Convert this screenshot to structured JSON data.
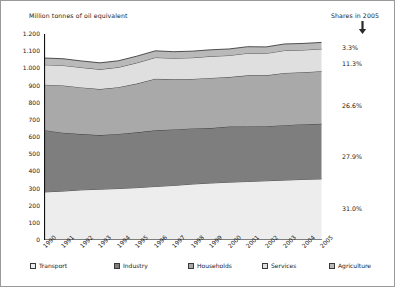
{
  "chart_data": {
    "type": "area",
    "title": "Million tonnes of oil equivalent",
    "subtitle": "Shares in 2005",
    "xlabel": "",
    "ylabel": "Million tonnes of oil equivalent",
    "ylim": [
      0,
      1200
    ],
    "ytick_step": 100,
    "grid": false,
    "legend_position": "bottom",
    "stacked": true,
    "categories": [
      "1990",
      "1991",
      "1992",
      "1993",
      "1994",
      "1995",
      "1996",
      "1997",
      "1998",
      "1999",
      "2000",
      "2001",
      "2002",
      "2003",
      "2004",
      "2005"
    ],
    "yticks": [
      "0",
      "100",
      "200",
      "300",
      "400",
      "500",
      "600",
      "700",
      "800",
      "900",
      "1.000",
      "1.100",
      "1.200"
    ],
    "series": [
      {
        "name": "Transport",
        "color": "#ededed",
        "share_2005": "31.0%",
        "values": [
          280,
          285,
          292,
          296,
          300,
          305,
          312,
          318,
          326,
          332,
          337,
          341,
          345,
          349,
          353,
          356
        ]
      },
      {
        "name": "Industry",
        "color": "#7e7e7e",
        "share_2005": "27.9%",
        "values": [
          360,
          340,
          325,
          315,
          318,
          322,
          327,
          326,
          324,
          320,
          324,
          320,
          318,
          320,
          322,
          321
        ]
      },
      {
        "name": "Households",
        "color": "#a9a9a9",
        "share_2005": "26.6%",
        "values": [
          265,
          275,
          272,
          268,
          272,
          284,
          300,
          292,
          288,
          292,
          288,
          298,
          296,
          304,
          302,
          306
        ]
      },
      {
        "name": "Services",
        "color": "#dfdfdf",
        "share_2005": "11.3%",
        "values": [
          116,
          117,
          116,
          115,
          116,
          121,
          124,
          123,
          124,
          126,
          126,
          129,
          128,
          131,
          130,
          130
        ]
      },
      {
        "name": "Agriculture",
        "color": "#b9b9b9",
        "share_2005": "3.3%",
        "values": [
          39,
          39,
          38,
          38,
          38,
          39,
          39,
          38,
          38,
          38,
          38,
          38,
          38,
          38,
          38,
          38
        ]
      }
    ],
    "totals": [
      1060,
      1056,
      1043,
      1032,
      1044,
      1071,
      1102,
      1097,
      1100,
      1108,
      1113,
      1126,
      1125,
      1142,
      1145,
      1151
    ]
  },
  "legend": {
    "items": [
      {
        "label": "Transport"
      },
      {
        "label": "Industry"
      },
      {
        "label": "Households"
      },
      {
        "label": "Services"
      },
      {
        "label": "Agriculture"
      }
    ]
  },
  "shares_panel": {
    "heading": "Shares in 2005",
    "labels": [
      "3.3%",
      "11.3%",
      "26.6%",
      "27.9%",
      "31.0%"
    ]
  }
}
